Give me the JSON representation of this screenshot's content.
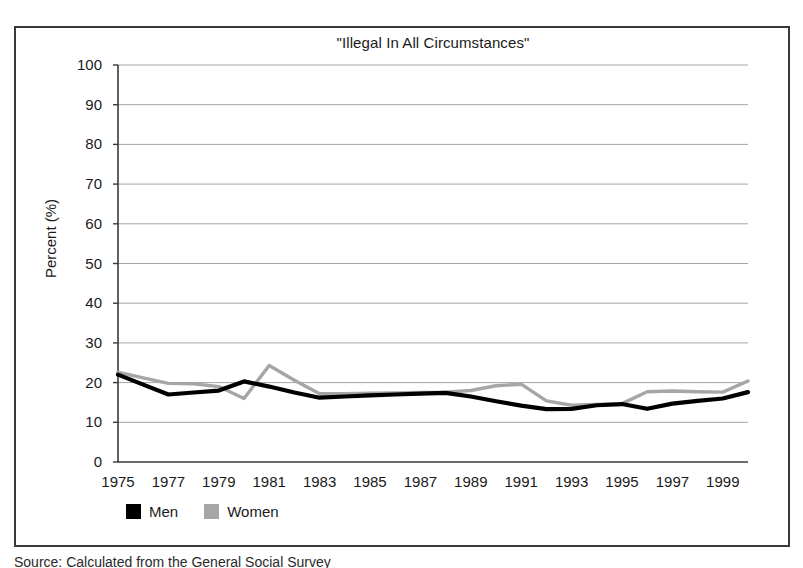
{
  "figure": {
    "title": "\"Illegal In All Circumstances\"",
    "source_note": "Source: Calculated from the General Social Survey",
    "ylabel": "Percent (%)"
  },
  "legend": {
    "items": [
      {
        "label": "Men",
        "color": "#000000",
        "swatch": "legend-swatch-men"
      },
      {
        "label": "Women",
        "color": "#a6a6a6",
        "swatch": "legend-swatch-women"
      }
    ]
  },
  "axes": {
    "y_ticks": [
      "100",
      "90",
      "80",
      "70",
      "60",
      "50",
      "40",
      "30",
      "20",
      "10",
      "0"
    ],
    "x_ticks": [
      "1975",
      "1977",
      "1979",
      "1981",
      "1983",
      "1985",
      "1987",
      "1989",
      "1991",
      "1993",
      "1995",
      "1997",
      "1999"
    ]
  },
  "chart_data": {
    "type": "line",
    "title": "\"Illegal In All Circumstances\"",
    "xlabel": "",
    "ylabel": "Percent (%)",
    "ylim": [
      0,
      100
    ],
    "xlim": [
      1975,
      2000
    ],
    "grid": "horizontal",
    "legend_position": "bottom-left",
    "x": [
      1975,
      1976,
      1977,
      1978,
      1979,
      1980,
      1981,
      1982,
      1983,
      1984,
      1985,
      1986,
      1987,
      1988,
      1989,
      1990,
      1991,
      1992,
      1993,
      1994,
      1995,
      1996,
      1997,
      1998,
      1999,
      2000
    ],
    "series": [
      {
        "name": "Men",
        "color": "#000000",
        "values": [
          22.0,
          19.5,
          17.0,
          17.5,
          18.0,
          20.3,
          19.0,
          17.5,
          16.2,
          16.5,
          16.8,
          17.0,
          17.2,
          17.4,
          16.5,
          15.3,
          14.2,
          13.3,
          13.4,
          14.3,
          14.6,
          13.4,
          14.7,
          15.4,
          16.0,
          17.6
        ]
      },
      {
        "name": "Women",
        "color": "#a6a6a6",
        "values": [
          22.6,
          21.2,
          19.8,
          19.7,
          19.0,
          16.0,
          24.3,
          20.6,
          17.2,
          17.2,
          17.3,
          17.4,
          17.5,
          17.6,
          18.0,
          19.2,
          19.6,
          15.4,
          14.3,
          14.5,
          14.7,
          17.7,
          17.9,
          17.7,
          17.6,
          20.4
        ]
      }
    ]
  }
}
